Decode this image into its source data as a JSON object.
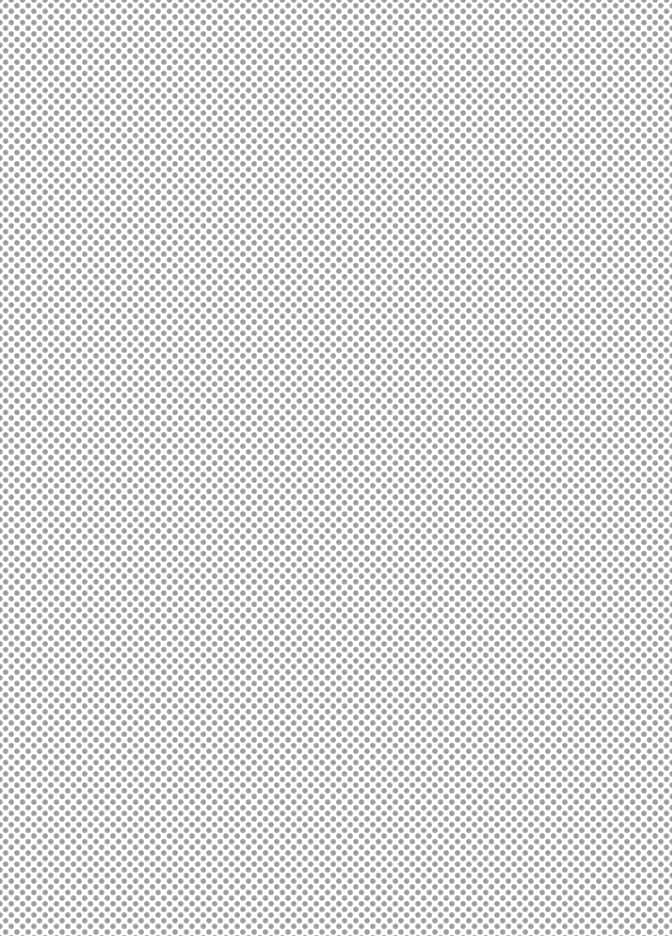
{
  "background": {
    "pattern": "staggered-dot-grid",
    "base_color": "#ffffff",
    "dot_color": "#9c9c9c",
    "dot_diameter_px": 5,
    "dot_spacing_px": 11.3,
    "row_offset_px": 5.65
  }
}
